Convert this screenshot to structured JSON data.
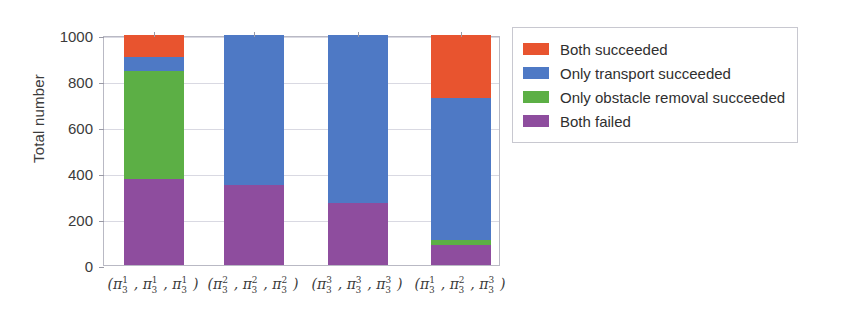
{
  "chart_data": {
    "type": "bar",
    "subtype": "stacked-bar",
    "title": "",
    "xlabel": "",
    "ylabel": "Total number",
    "ylim": [
      0,
      1000
    ],
    "yticks": [
      0,
      200,
      400,
      600,
      800,
      1000
    ],
    "ytick_labels": [
      "0",
      "200",
      "400",
      "600",
      "800",
      "1000"
    ],
    "grid": true,
    "grid_axis": "y",
    "legend_position": "right-outside",
    "categories": [
      "(π¹₃, π¹₃, π¹₃)",
      "(π²₃, π²₃, π²₃)",
      "(π³₃, π³₃, π³₃)",
      "(π¹₃, π²₃, π³₃)"
    ],
    "category_parts": [
      [
        {
          "sup": "1",
          "sub": "3"
        },
        {
          "sup": "1",
          "sub": "3"
        },
        {
          "sup": "1",
          "sub": "3"
        }
      ],
      [
        {
          "sup": "2",
          "sub": "3"
        },
        {
          "sup": "2",
          "sub": "3"
        },
        {
          "sup": "2",
          "sub": "3"
        }
      ],
      [
        {
          "sup": "3",
          "sub": "3"
        },
        {
          "sup": "3",
          "sub": "3"
        },
        {
          "sup": "3",
          "sub": "3"
        }
      ],
      [
        {
          "sup": "1",
          "sub": "3"
        },
        {
          "sup": "2",
          "sub": "3"
        },
        {
          "sup": "3",
          "sub": "3"
        }
      ]
    ],
    "series": [
      {
        "name": "Both failed",
        "color": "#8E4D9E",
        "values": [
          375,
          350,
          270,
          85
        ]
      },
      {
        "name": "Only obstacle removal succeeded",
        "color": "#5CAF45",
        "values": [
          470,
          0,
          0,
          25
        ]
      },
      {
        "name": "Only transport succeeded",
        "color": "#4E79C5",
        "values": [
          60,
          650,
          730,
          615
        ]
      },
      {
        "name": "Both succeeded",
        "color": "#E8542F",
        "values": [
          95,
          0,
          0,
          275
        ]
      }
    ],
    "stack_order_bottom_to_top": [
      "Both failed",
      "Only obstacle removal succeeded",
      "Only transport succeeded",
      "Both succeeded"
    ],
    "totals": [
      1000,
      1000,
      1000,
      1000
    ]
  },
  "legend": {
    "items": [
      {
        "label": "Both succeeded",
        "color": "#E8542F"
      },
      {
        "label": "Only transport succeeded",
        "color": "#4E79C5"
      },
      {
        "label": "Only obstacle removal succeeded",
        "color": "#5CAF45"
      },
      {
        "label": "Both failed",
        "color": "#8E4D9E"
      }
    ]
  }
}
